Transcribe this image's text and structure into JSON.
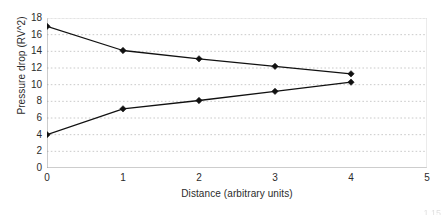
{
  "chart_data": {
    "type": "line",
    "title": "",
    "xlabel": "Distance (arbitrary units)",
    "ylabel": "Pressure drop (RV^2)",
    "xlim": [
      0,
      5
    ],
    "ylim": [
      0,
      18
    ],
    "xticks": [
      "0",
      "1",
      "2",
      "3",
      "4",
      "5"
    ],
    "yticks": [
      "0",
      "2",
      "4",
      "6",
      "8",
      "10",
      "12",
      "14",
      "16",
      "18"
    ],
    "grid": "horizontal-dotted",
    "legend": "none",
    "marker": "diamond",
    "line_color": "#111111",
    "grid_color": "#bdbdbd",
    "axis_color": "#9a9a9a",
    "x": [
      0,
      1,
      2,
      3,
      4
    ],
    "series": [
      {
        "name": "upper-branch",
        "values": [
          17.0,
          14.1,
          13.1,
          12.2,
          11.3
        ]
      },
      {
        "name": "lower-branch",
        "values": [
          4.0,
          7.1,
          8.1,
          9.2,
          10.3
        ]
      }
    ]
  },
  "bleed": {
    "text": "1 15"
  }
}
